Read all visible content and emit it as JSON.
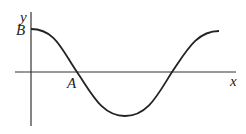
{
  "diagram": {
    "type": "cosine-like wave graph",
    "axes": {
      "x_label": "x",
      "y_label": "y"
    },
    "points": {
      "B": {
        "label": "B",
        "description": "y-intercept, maximum of curve"
      },
      "A": {
        "label": "A",
        "description": "first x-intercept of curve"
      }
    },
    "colors": {
      "line": "#222222",
      "axis": "#333333",
      "background": "#ffffff"
    }
  }
}
